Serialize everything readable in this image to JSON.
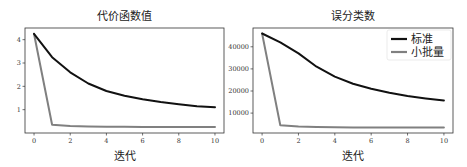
{
  "chart_data": [
    {
      "type": "line",
      "title": "代价函数值",
      "xlabel": "迭代",
      "ylabel": "",
      "x": [
        0,
        1,
        2,
        3,
        4,
        5,
        6,
        7,
        8,
        9,
        10
      ],
      "xticks": [
        0,
        2,
        4,
        6,
        8,
        10
      ],
      "yticks": [
        1,
        2,
        3,
        4
      ],
      "xlim": [
        -0.5,
        10.5
      ],
      "ylim": [
        0.0,
        4.5
      ],
      "grid": false,
      "legend": null,
      "series": [
        {
          "name": "标准",
          "color": "#111111",
          "values": [
            4.25,
            3.25,
            2.6,
            2.12,
            1.8,
            1.6,
            1.45,
            1.33,
            1.23,
            1.15,
            1.1
          ]
        },
        {
          "name": "小批量",
          "color": "#808080",
          "values": [
            4.25,
            0.35,
            0.3,
            0.28,
            0.27,
            0.27,
            0.26,
            0.26,
            0.26,
            0.26,
            0.26
          ]
        }
      ]
    },
    {
      "type": "line",
      "title": "误分类数",
      "xlabel": "迭代",
      "ylabel": "",
      "x": [
        0,
        1,
        2,
        3,
        4,
        5,
        6,
        7,
        8,
        9,
        10
      ],
      "xticks": [
        0,
        2,
        4,
        6,
        8,
        10
      ],
      "yticks": [
        10000,
        20000,
        30000,
        40000
      ],
      "xlim": [
        -0.5,
        10.5
      ],
      "ylim": [
        1000,
        48500
      ],
      "grid": false,
      "legend": {
        "position": "upper right",
        "entries": [
          "标准",
          "小批量"
        ]
      },
      "series": [
        {
          "name": "标准",
          "color": "#111111",
          "values": [
            46000,
            42000,
            37000,
            31000,
            26500,
            23300,
            21000,
            19200,
            17700,
            16600,
            15700
          ]
        },
        {
          "name": "小批量",
          "color": "#808080",
          "values": [
            46000,
            4500,
            4000,
            3700,
            3600,
            3500,
            3500,
            3500,
            3500,
            3500,
            3500
          ]
        }
      ]
    }
  ]
}
